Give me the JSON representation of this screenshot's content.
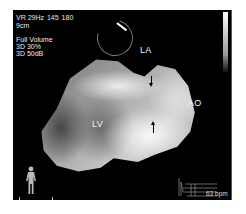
{
  "overlay": {
    "mode_line": "VR 29Hz",
    "angle_start": "145",
    "angle_end": "180",
    "depth": "9cm",
    "acq_mode": "Full Volume",
    "param1": "3D 30%",
    "param2": "3D 50dB"
  },
  "labels": {
    "la": "LA",
    "ao": "AO",
    "lv": "LV"
  },
  "heart_rate": "63 bpm",
  "colors": {
    "background": "#000000",
    "text": "#e8e8e8",
    "page": "#ffffff"
  },
  "icons": {
    "body_orientation": "human-body-icon",
    "ecg_trace": "ecg-waveform-icon",
    "angle_dial": "rotation-dial-icon",
    "grayscale_bar": "grayscale-bar"
  }
}
